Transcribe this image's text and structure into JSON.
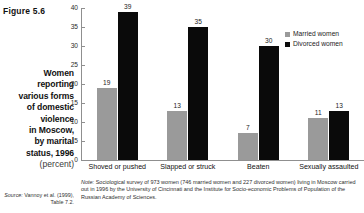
{
  "figure": {
    "number_label": "Figure 5.6",
    "caption_lines": [
      "Women",
      "reporting",
      "various forms",
      "of domestic",
      "violence",
      "in Moscow,",
      "by marital",
      "status, 1996"
    ],
    "caption_unit": "(percent)",
    "source_label": "Source:",
    "source_text": "Vannoy et al. (1999), Table 7.2.",
    "note_label": "Note:",
    "note_text": "Sociological survey of 973 women (746 married women and 227 divorced women) living in Moscow carried out in 1996 by the University of Cincinnati and the Institute for Socio-economic Problems of Population of the Russian Academy of Sciences."
  },
  "colors": {
    "married": "#9a9a9a",
    "divorced": "#0a0a0a",
    "axis": "#8f8f8f",
    "text": "#1a1a1a",
    "background": "#ffffff"
  },
  "legend": {
    "position": "top-right",
    "entries": [
      {
        "label": "Married women",
        "color": "#9a9a9a",
        "swatch": "square-swatch"
      },
      {
        "label": "Divorced women",
        "color": "#0a0a0a",
        "swatch": "square-swatch"
      }
    ]
  },
  "chart_data": {
    "type": "bar",
    "title": "Women reporting various forms of domestic violence in Moscow, by marital status, 1996",
    "subtitle": "(percent)",
    "xlabel": "",
    "ylabel": "",
    "ylim": [
      0,
      40
    ],
    "yticks": [
      0,
      5,
      10,
      15,
      20,
      25,
      30,
      35,
      40
    ],
    "ytick_labels": [
      "0",
      "5",
      "10",
      "15",
      "20",
      "25",
      "30",
      "35",
      "40"
    ],
    "grid": false,
    "legend_position": "top-right",
    "categories": [
      "Shoved or pushed",
      "Slapped or struck",
      "Beaten",
      "Sexually assaulted"
    ],
    "series": [
      {
        "name": "Married women",
        "color": "#9a9a9a",
        "values": [
          19,
          13,
          7,
          11
        ]
      },
      {
        "name": "Divorced women",
        "color": "#0a0a0a",
        "values": [
          39,
          35,
          30,
          13
        ]
      }
    ],
    "data_labels": [
      "19",
      "39",
      "13",
      "35",
      "7",
      "30",
      "11",
      "13"
    ]
  }
}
